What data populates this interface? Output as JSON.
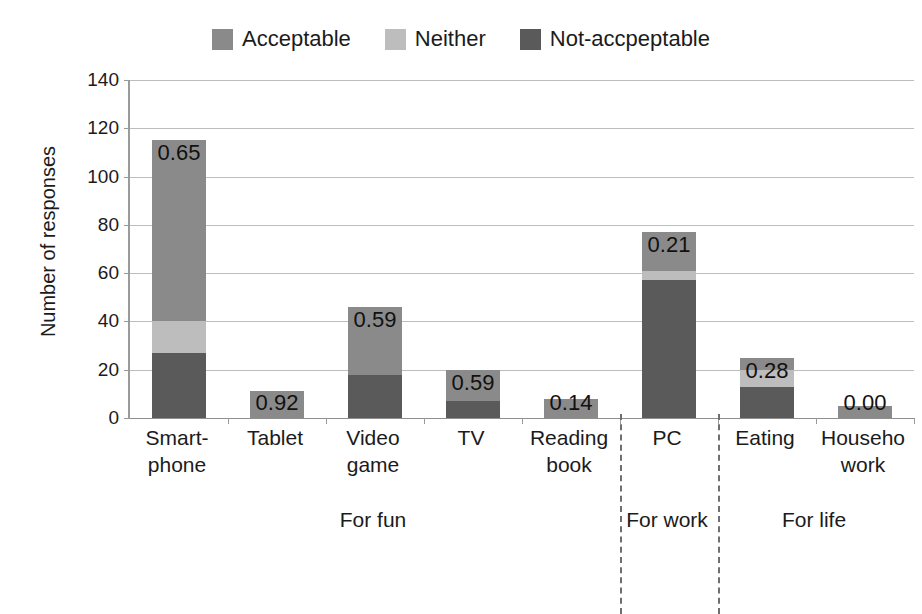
{
  "chart_data": {
    "type": "bar",
    "stacked": true,
    "title": "",
    "subtitle": "",
    "xlabel": "",
    "ylabel": "Number of responses",
    "ylim": [
      0,
      140
    ],
    "ytick_step": 20,
    "yticks": [
      "0",
      "20",
      "40",
      "60",
      "80",
      "100",
      "120",
      "140"
    ],
    "grid": true,
    "legend_position": "top-center",
    "categories": [
      "Smart-\nphone",
      "Tablet",
      "Video\ngame",
      "TV",
      "Reading\nbook",
      "PC",
      "Eating",
      "Househo\nwork"
    ],
    "category_lines": [
      [
        "Smart-",
        "phone"
      ],
      [
        "Tablet",
        ""
      ],
      [
        "Video",
        "game"
      ],
      [
        "TV",
        ""
      ],
      [
        "Reading",
        "book"
      ],
      [
        "PC",
        ""
      ],
      [
        "Eating",
        ""
      ],
      [
        "Househo",
        "work"
      ]
    ],
    "series": [
      {
        "name": "Not-accpeptable",
        "color": "#5a5a5a",
        "values": [
          27,
          0,
          18,
          7,
          0,
          57,
          13,
          0
        ]
      },
      {
        "name": "Neither",
        "color": "#bdbdbd",
        "values": [
          13,
          0,
          0,
          0,
          0,
          4,
          7,
          0
        ]
      },
      {
        "name": "Acceptable",
        "color": "#8a8a8a",
        "values": [
          75,
          11,
          28,
          13,
          8,
          16,
          5,
          5
        ]
      }
    ],
    "totals": [
      115,
      11,
      46,
      20,
      8,
      77,
      25,
      5
    ],
    "data_labels": [
      "0.65",
      "0.92",
      "0.59",
      "0.59",
      "0.14",
      "0.21",
      "0.28",
      "0.00"
    ],
    "data_label_note": "Proportion label printed above/within each stacked bar",
    "groups": [
      {
        "label": "For fun",
        "categories": [
          "Smart-phone",
          "Tablet",
          "Video game",
          "TV",
          "Reading book"
        ]
      },
      {
        "label": "For work",
        "categories": [
          "PC"
        ]
      },
      {
        "label": "For life",
        "categories": [
          "Eating",
          "Househo work"
        ]
      }
    ]
  },
  "legend": {
    "items": [
      {
        "label": "Acceptable",
        "color": "#8a8a8a"
      },
      {
        "label": "Neither",
        "color": "#bdbdbd"
      },
      {
        "label": "Not-accpeptable",
        "color": "#5a5a5a"
      }
    ]
  },
  "axes": {
    "y_title": "Number of responses"
  }
}
